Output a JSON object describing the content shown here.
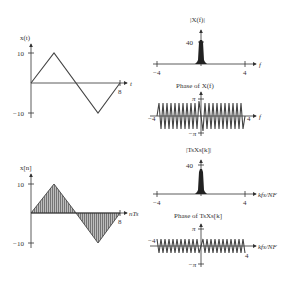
{
  "figure": {
    "panels": [
      {
        "id": "xt",
        "ylabel": "x(t)",
        "xlabel": "t",
        "yticks": [
          "10",
          "−10"
        ],
        "xticks": [
          "8"
        ]
      },
      {
        "id": "mag_X",
        "title": "|X(f)|",
        "xlabel": "f",
        "yticks": [
          "40"
        ],
        "xticks": [
          "−4",
          "4"
        ]
      },
      {
        "id": "phase_X",
        "title": "Phase of X(f)",
        "xlabel": "f",
        "yticks": [
          "π",
          "−π"
        ],
        "xticks": [
          "−4",
          "4"
        ]
      },
      {
        "id": "xn",
        "ylabel": "x[n]",
        "xlabel": "nTs",
        "yticks": [
          "10",
          "−10"
        ],
        "xticks": [
          "8"
        ]
      },
      {
        "id": "mag_Xs",
        "title": "|TsXs[k]|",
        "xlabel": "kfs/NF",
        "yticks": [
          "40"
        ],
        "xticks": [
          "−4",
          "4"
        ]
      },
      {
        "id": "phase_Xs",
        "title": "Phase of TsXs[k]",
        "xlabel": "kfs/NF",
        "yticks": [
          "π",
          "−π"
        ],
        "xticks": [
          "−4",
          "4"
        ]
      }
    ]
  },
  "labels": {
    "xt_ylabel": "x(t)",
    "xt_xlabel": "t",
    "xt_ytick_pos": "10",
    "xt_ytick_neg": "−10",
    "xt_xtick": "8",
    "magX_title": "|X(f)|",
    "magX_ytick": "40",
    "magX_xtick_neg": "−4",
    "magX_xtick_pos": "4",
    "magX_xlabel": "f",
    "phX_title": "Phase of X(f)",
    "phX_pi": "π",
    "phX_negpi": "−π",
    "phX_xtick_neg": "−4",
    "phX_xtick_pos": "4",
    "phX_xlabel": "f",
    "xn_ylabel": "x[n]",
    "xn_xlabel": "nTs",
    "xn_ytick_pos": "10",
    "xn_ytick_neg": "−10",
    "xn_xtick": "8",
    "magXs_title": "|TsXs[k]|",
    "magXs_ytick": "40",
    "magXs_xtick_neg": "−4",
    "magXs_xtick_pos": "4",
    "magXs_xlabel": "kfs/NF",
    "phXs_title": "Phase of TsXs[k]",
    "phXs_pi": "π",
    "phXs_negpi": "−π",
    "phXs_xtick_neg": "−4",
    "phXs_xtick_pos": "4",
    "phXs_xlabel": "kfs/NF"
  },
  "colors": {
    "ink": "#333333",
    "fill": "#9a9a9a"
  }
}
